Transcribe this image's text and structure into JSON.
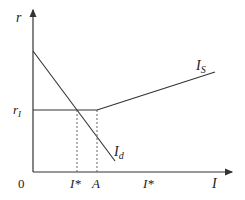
{
  "diagram": {
    "y_axis_label": "r",
    "x_axis_label": "I",
    "origin_label": "0",
    "rate_level_label": "r",
    "rate_level_subscript": "I",
    "supply_curve_label": "I",
    "supply_curve_subscript": "S",
    "demand_curve_label": "I",
    "demand_curve_subscript": "d",
    "x_tick_labels": [
      "I*",
      "A",
      "I*"
    ],
    "colors": {
      "line": "#333333",
      "dotted": "#555555",
      "background": "#ffffff"
    }
  }
}
